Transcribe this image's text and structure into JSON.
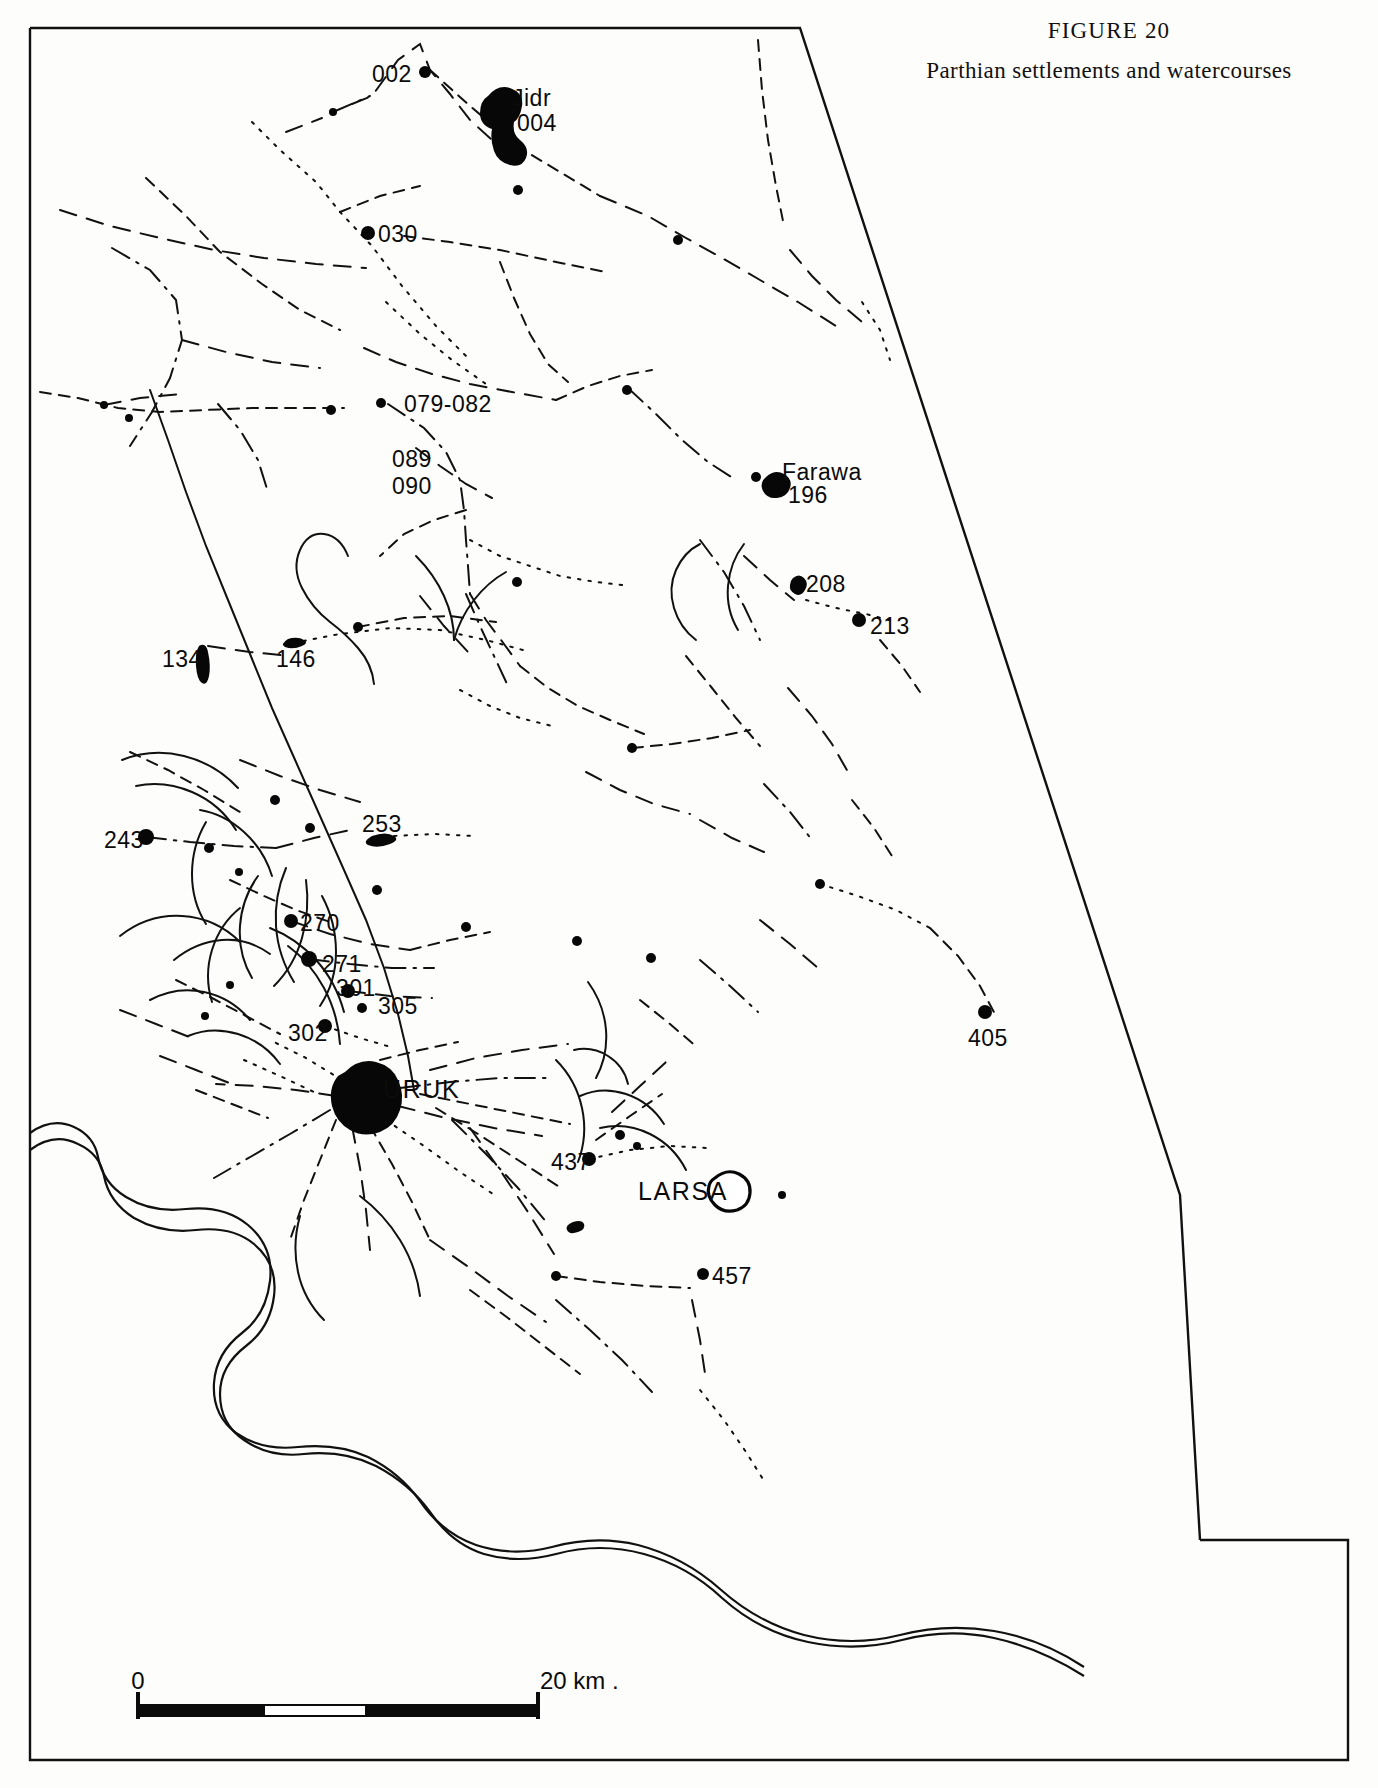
{
  "figure": {
    "number": "FIGURE 20",
    "title": "Parthian settlements and watercourses"
  },
  "scale_bar": {
    "left_label": "0",
    "right_label": "20 km .",
    "units": "km",
    "length_km": 20
  },
  "map": {
    "labels": [
      {
        "id": "002",
        "text": "002",
        "x": 372,
        "y": 82,
        "anchor": "start"
      },
      {
        "id": "jidr",
        "text": "Jidr",
        "x": 512,
        "y": 106,
        "anchor": "start"
      },
      {
        "id": "004",
        "text": "004",
        "x": 517,
        "y": 131,
        "anchor": "start"
      },
      {
        "id": "030",
        "text": "030",
        "x": 378,
        "y": 242,
        "anchor": "start"
      },
      {
        "id": "079-082",
        "text": "079-082",
        "x": 404,
        "y": 412,
        "anchor": "start"
      },
      {
        "id": "089",
        "text": "089",
        "x": 392,
        "y": 467,
        "anchor": "start"
      },
      {
        "id": "090",
        "text": "090",
        "x": 392,
        "y": 494,
        "anchor": "start"
      },
      {
        "id": "farawa",
        "text": "Farawa",
        "x": 782,
        "y": 480,
        "anchor": "start"
      },
      {
        "id": "196",
        "text": "196",
        "x": 788,
        "y": 503,
        "anchor": "start"
      },
      {
        "id": "208",
        "text": "208",
        "x": 806,
        "y": 592,
        "anchor": "start"
      },
      {
        "id": "213",
        "text": "213",
        "x": 870,
        "y": 634,
        "anchor": "start"
      },
      {
        "id": "134",
        "text": "134",
        "x": 162,
        "y": 667,
        "anchor": "start"
      },
      {
        "id": "146",
        "text": "146",
        "x": 276,
        "y": 667,
        "anchor": "start"
      },
      {
        "id": "243",
        "text": "243",
        "x": 104,
        "y": 848,
        "anchor": "start"
      },
      {
        "id": "253",
        "text": "253",
        "x": 362,
        "y": 832,
        "anchor": "start"
      },
      {
        "id": "270",
        "text": "270",
        "x": 300,
        "y": 931,
        "anchor": "start"
      },
      {
        "id": "271",
        "text": "271",
        "x": 322,
        "y": 972,
        "anchor": "start"
      },
      {
        "id": "301",
        "text": "301",
        "x": 336,
        "y": 996,
        "anchor": "start"
      },
      {
        "id": "305",
        "text": "305",
        "x": 378,
        "y": 1014,
        "anchor": "start"
      },
      {
        "id": "302",
        "text": "302",
        "x": 288,
        "y": 1041,
        "anchor": "start"
      },
      {
        "id": "405",
        "text": "405",
        "x": 968,
        "y": 1046,
        "anchor": "start"
      },
      {
        "id": "uruk",
        "text": "URUK",
        "x": 383,
        "y": 1098,
        "anchor": "start",
        "major": true
      },
      {
        "id": "437",
        "text": "437",
        "x": 551,
        "y": 1170,
        "anchor": "start"
      },
      {
        "id": "larsa",
        "text": "LARSA",
        "x": 638,
        "y": 1200,
        "anchor": "start",
        "major": true
      },
      {
        "id": "457",
        "text": "457",
        "x": 712,
        "y": 1284,
        "anchor": "start"
      }
    ],
    "sites": [
      {
        "id": "site-002",
        "x": 425,
        "y": 72,
        "r": 6
      },
      {
        "id": "site-004",
        "x": 500,
        "y": 112,
        "r": 0
      },
      {
        "id": "site-030",
        "x": 368,
        "y": 233,
        "r": 7
      },
      {
        "id": "site-196",
        "x": 756,
        "y": 477,
        "r": 5
      },
      {
        "id": "site-213",
        "x": 859,
        "y": 620,
        "r": 7
      },
      {
        "id": "site-243",
        "x": 146,
        "y": 837,
        "r": 8
      },
      {
        "id": "site-270",
        "x": 291,
        "y": 921,
        "r": 7
      },
      {
        "id": "site-271",
        "x": 309,
        "y": 959,
        "r": 8
      },
      {
        "id": "site-301",
        "x": 348,
        "y": 991,
        "r": 7
      },
      {
        "id": "site-305",
        "x": 362,
        "y": 1008,
        "r": 5
      },
      {
        "id": "site-302",
        "x": 325,
        "y": 1026,
        "r": 7
      },
      {
        "id": "site-405",
        "x": 985,
        "y": 1012,
        "r": 7
      },
      {
        "id": "site-437",
        "x": 589,
        "y": 1159,
        "r": 7
      },
      {
        "id": "site-457",
        "x": 703,
        "y": 1274,
        "r": 6
      },
      {
        "id": "site-a1",
        "x": 333,
        "y": 112,
        "r": 4
      },
      {
        "id": "site-a2",
        "x": 518,
        "y": 190,
        "r": 5
      },
      {
        "id": "site-a3",
        "x": 678,
        "y": 240,
        "r": 5
      },
      {
        "id": "site-a4",
        "x": 104,
        "y": 405,
        "r": 4
      },
      {
        "id": "site-a5",
        "x": 129,
        "y": 418,
        "r": 4
      },
      {
        "id": "site-a6",
        "x": 331,
        "y": 410,
        "r": 5
      },
      {
        "id": "site-a7",
        "x": 381,
        "y": 403,
        "r": 5
      },
      {
        "id": "site-a8",
        "x": 517,
        "y": 582,
        "r": 5
      },
      {
        "id": "site-a9",
        "x": 627,
        "y": 390,
        "r": 5
      },
      {
        "id": "site-a10",
        "x": 293,
        "y": 643,
        "r": 5
      },
      {
        "id": "site-a11",
        "x": 358,
        "y": 627,
        "r": 5
      },
      {
        "id": "site-a12",
        "x": 632,
        "y": 748,
        "r": 5
      },
      {
        "id": "site-a13",
        "x": 275,
        "y": 800,
        "r": 5
      },
      {
        "id": "site-a14",
        "x": 310,
        "y": 828,
        "r": 5
      },
      {
        "id": "site-a15",
        "x": 209,
        "y": 848,
        "r": 5
      },
      {
        "id": "site-a16",
        "x": 239,
        "y": 872,
        "r": 4
      },
      {
        "id": "site-a17",
        "x": 377,
        "y": 890,
        "r": 5
      },
      {
        "id": "site-a18",
        "x": 466,
        "y": 927,
        "r": 5
      },
      {
        "id": "site-a19",
        "x": 577,
        "y": 941,
        "r": 5
      },
      {
        "id": "site-a20",
        "x": 651,
        "y": 958,
        "r": 5
      },
      {
        "id": "site-a21",
        "x": 820,
        "y": 884,
        "r": 5
      },
      {
        "id": "site-a22",
        "x": 620,
        "y": 1135,
        "r": 5
      },
      {
        "id": "site-a23",
        "x": 637,
        "y": 1146,
        "r": 4
      },
      {
        "id": "site-a24",
        "x": 556,
        "y": 1276,
        "r": 5
      },
      {
        "id": "site-a25",
        "x": 782,
        "y": 1195,
        "r": 4
      },
      {
        "id": "site-a26",
        "x": 230,
        "y": 985,
        "r": 4
      },
      {
        "id": "site-a27",
        "x": 205,
        "y": 1016,
        "r": 4
      }
    ],
    "mounds": [
      {
        "id": "mound-jidr",
        "filled": true,
        "path": "M488,96 q10,-12 22,-8 q14,5 12,18 q-2,12 -8,16 q-2,12 6,18 q10,8 6,18 q-4,10 -16,7 q-12,-3 -16,-14 q-4,-12 -2,-22 q-12,-4 -12,-16 q0,-12 8,-17 Z"
      },
      {
        "id": "mound-134",
        "filled": true,
        "path": "M199,646 q7,-4 9,6 q3,14 1,24 q-2,10 -7,7 q-5,-3 -6,-17 q-1,-14 3,-20 Z"
      },
      {
        "id": "mound-146",
        "filled": true,
        "path": "M288,639 q10,-3 16,1 q5,3 -2,6 q-9,4 -17,1 q-5,-3 3,-8 Z"
      },
      {
        "id": "mound-196",
        "filled": true,
        "path": "M766,477 q9,-8 18,-3 q9,5 6,14 q-3,9 -13,10 q-10,1 -14,-7 q-4,-8 3,-14 Z"
      },
      {
        "id": "mound-208",
        "filled": true,
        "path": "M793,578 q6,-5 11,0 q5,5 1,12 q-4,7 -10,4 q-6,-3 -5,-9 q0,-4 3,-7 Z"
      },
      {
        "id": "mound-253",
        "filled": true,
        "path": "M372,836 q14,-5 22,0 q6,4 -4,8 q-13,5 -22,1 q-6,-3 4,-9 Z"
      },
      {
        "id": "mound-uruk",
        "filled": true,
        "path": "M345,1072 q14,-14 31,-10 q16,4 22,18 q7,15 2,30 q-5,16 -20,22 q-16,6 -30,-2 q-14,-8 -18,-24 q-4,-18 6,-30 Z"
      },
      {
        "id": "mound-larsa",
        "filled": false,
        "path": "M715,1178 q12,-10 24,-4 q12,6 11,19 q-1,13 -13,17 q-13,4 -22,-5 q-9,-9 -6,-19 q1,-5 6,-8 Z"
      },
      {
        "id": "mound-sm1",
        "filled": true,
        "path": "M573,1222 q9,-3 11,2 q2,5 -6,8 q-9,3 -11,-2 q-2,-5 6,-8 Z"
      }
    ],
    "boundary_path": "M30,28 L800,28 L1180,1200 L1205,1540 L1348,1540 L1348,1760 L30,1760 Z",
    "boundary_visible": "M30,28 L800,28 L1180,1195 L1200,1540 M30,28 L30,1760 L1348,1760 L1348,1540 L1200,1540",
    "rivers": [
      "M30,1133 q22,-16 44,-6 q20,9 24,30 q5,26 28,40 q26,16 60,12 q38,-4 62,16 q26,22 22,56 q-4,34 -28,52 q-26,20 -28,50 q-2,32 22,50 q26,18 62,14 q40,-4 70,10 q32,16 52,44 q22,32 56,44 q36,12 76,2 q44,-12 86,-2 q46,12 82,44 q38,34 84,46 q48,12 96,0 q46,-12 94,-4 q48,8 90,36",
      "M30,1150 q24,-18 48,-6 q22,10 26,32 q5,26 30,42 q28,16 62,12 q36,-4 58,14 q24,20 20,52 q-4,32 -28,50 q-26,20 -26,48 q0,30 24,46 q26,18 60,14 q40,-4 72,12 q34,18 54,46 q22,32 54,42 q34,10 72,0 q44,-12 88,0 q44,12 78,44 q38,34 86,44 q48,10 94,-2 q46,-12 92,-2 q46,10 90,38"
    ],
    "watercourses_dash": [
      "M352,104 L372,96 L398,60 L420,44 L430,70 L450,94 L470,120 L492,140",
      "M430,70 L470,106 L520,148 L560,172 L600,196",
      "M333,112 L370,96",
      "M286,132 L322,118",
      "M252,122 L280,150 L316,182 L340,212 L372,246 L402,286 L436,326 L466,356",
      "M146,178 L186,216 L220,252 L262,284 L300,310 L340,330",
      "M60,210 L110,226 L160,238 L214,250 L264,258 L316,264 L366,268",
      "M404,236 L450,242 L500,250 L556,262 L606,272",
      "M112,248 L150,270 L176,300 L182,340 L170,378 L152,412 L130,446",
      "M182,340 L226,352 L272,362 L320,368",
      "M386,302 L420,334 L452,360 L486,384",
      "M500,262 L514,298 L530,334 L548,364 L568,382",
      "M364,348 L396,362 L432,374 L470,384 L512,392 L556,400",
      "M40,392 L78,398 L118,408 L160,412 L206,410 L252,408 L300,408 L344,408",
      "M388,404 L424,428 L446,452 L460,480 L464,510 L466,540 L468,566 L470,594",
      "M470,594 L486,620 L504,644 L520,666",
      "M470,540 L500,556 L530,566 L560,576 L596,582 L630,586",
      "M466,510 L434,520 L404,534 L380,556",
      "M416,448 L440,466 L466,484 L492,498",
      "M556,400 L588,386 L620,376 L652,370",
      "M628,388 L656,414 L682,440 L708,462 L736,480",
      "M600,196 L648,216 L686,238 L722,258 L760,280 L798,302 L836,326",
      "M862,302 L880,330 L890,360",
      "M758,40 L762,90 L768,140 L776,186 L784,226",
      "M790,250 L812,276 L836,300 L862,322",
      "M340,212 L380,196 L420,186",
      "M218,404 L240,430 L258,460 L268,492",
      "M104,405 L140,398 L180,394",
      "M293,643 L340,634 L390,628 L440,630 L486,640 L530,652",
      "M358,627 L404,618 L450,616 L496,622",
      "M208,646 L250,652 L290,656",
      "M520,666 L548,688 L578,706 L610,720 L644,734",
      "M466,594 L480,626 L494,656 L508,686",
      "M420,596 L444,626 L468,652",
      "M460,690 L490,706 L520,718 L552,726",
      "M632,748 L672,744 L712,738 L750,730",
      "M586,772 L620,790 L654,804 L690,814",
      "M686,656 L712,688 L736,718 L760,746",
      "M700,540 L724,572 L744,606 L760,640",
      "M744,556 L770,580 L794,600",
      "M806,600 L836,608 L866,614 L896,622",
      "M880,640 L902,666 L920,692",
      "M788,688 L812,716 L832,744 L848,772",
      "M852,800 L874,828 L892,856",
      "M764,784 L790,812 L812,840",
      "M700,820 L732,838 L764,852",
      "M820,884 L858,896 L896,910 L930,928",
      "M930,928 L958,956 L980,986 L996,1016",
      "M240,760 L280,776 L320,790 L360,802",
      "M130,752 L168,770 L204,790 L240,812",
      "M146,837 L190,842 L234,846 L276,848",
      "M276,848 L314,838 L350,830",
      "M394,836 L434,834 L474,836",
      "M230,880 L264,896 L296,910 L330,922",
      "M291,921 L330,934 L370,944 L410,950",
      "M410,950 L450,940 L490,932",
      "M309,959 L350,964 L392,968 L434,968",
      "M348,991 L390,996 L432,998",
      "M325,1026 L360,1038 L394,1048",
      "M176,980 L212,998 L246,1016 L280,1034",
      "M120,1010 L156,1024 L192,1038",
      "M380,1060 L420,1050 L458,1042",
      "M400,1088 L450,1082 L500,1078 L550,1078",
      "M398,1106 L446,1118 L494,1128 L542,1136",
      "M386,1120 L424,1146 L460,1172 L496,1196",
      "M370,1126 L392,1164 L412,1202 L430,1240",
      "M352,1126 L360,1168 L366,1210 L370,1250",
      "M336,1120 L320,1160 L304,1200 L290,1240",
      "M330,1110 L290,1134 L252,1156 L214,1178",
      "M336,1096 L296,1090 L256,1086 L216,1084",
      "M342,1080 L306,1058 L270,1040",
      "M420,1094 L470,1104 L520,1114 L570,1124",
      "M430,1070 L476,1058 L522,1050 L568,1044",
      "M436,1108 L478,1134 L518,1160 L558,1186",
      "M452,1120 L486,1154 L518,1188 L548,1224",
      "M470,1128 L500,1170 L528,1212 L554,1254",
      "M589,1159 L630,1150 L670,1146 L708,1148",
      "M556,1276 L600,1282 L646,1286 L690,1288",
      "M430,1240 L470,1268 L508,1296 L546,1322",
      "M470,1290 L508,1318 L544,1346 L580,1374",
      "M556,1300 L590,1330 L622,1360 L652,1392",
      "M692,1300 L700,1340 L706,1380",
      "M700,1390 L724,1420 L746,1452 L766,1484",
      "M596,1140 L630,1116 L662,1094",
      "M612,1112 L640,1086 L666,1062",
      "M640,1000 L670,1024 L698,1048",
      "M700,960 L730,986 L758,1012",
      "M760,920 L790,944 L818,968",
      "M244,1060 L280,1076 L314,1092",
      "M196,1090 L232,1104 L268,1118",
      "M160,1056 L196,1070 L232,1084"
    ],
    "watercourses_solid": [
      "M150,390 L168,440 L186,492 L206,546 L228,600 L250,654 L272,708 L296,762 L320,816 L344,870 L366,920 L384,968 L398,1014 L408,1056 L414,1090",
      "M348,556 q-8,-20 -24,-22 q-16,-2 -24,16 q-8,18 2,38 q10,20 28,34 q16,12 28,26 q14,16 16,36",
      "M416,556 q18,18 28,40 q10,22 10,44",
      "M454,640 q6,-22 20,-40 q14,-18 32,-28",
      "M700,544 q-16,8 -24,26 q-8,18 -2,38 q6,20 22,32",
      "M744,544 q-14,18 -16,42 q-2,24 10,44",
      "M588,982 q16,22 18,48 q2,26 -10,48",
      "M574,1050 q18,-4 34,6 q16,10 20,28",
      "M174,960 q22,-18 48,-20 q26,-2 48,14",
      "M150,1000 q26,-14 54,-8 q28,6 46,28",
      "M188,1036 q24,-10 50,-2 q26,8 42,30",
      "M120,936 q28,-22 62,-20 q34,2 58,26",
      "M122,760 q30,-12 62,-4 q32,8 54,32",
      "M136,786 q28,-6 56,6 q28,12 44,38",
      "M200,810 q24,4 44,22 q20,18 28,44",
      "M206,822 q-14,24 -14,52 q0,28 14,50",
      "M258,876 q-16,22 -18,50 q-2,28 12,52",
      "M240,908 q-20,16 -28,42 q-8,26 0,52",
      "M286,868 q-12,28 -10,58 q2,30 18,56",
      "M306,880 q4,30 -4,58 q-8,28 -28,48",
      "M322,896 q14,26 14,56 q0,30 -16,54",
      "M270,928 q26,10 46,32 q20,22 28,52",
      "M288,946 q22,16 36,42 q14,26 16,56",
      "M556,1060 q20,20 26,48 q6,28 -4,54",
      "M580,1096 q22,-10 46,-2 q24,8 38,30",
      "M600,1128 q26,-6 50,6 q24,12 36,36",
      "M360,1196 q24,18 40,44 q16,26 20,56",
      "M300,1216 q-8,28 -2,56 q6,28 26,48"
    ]
  }
}
